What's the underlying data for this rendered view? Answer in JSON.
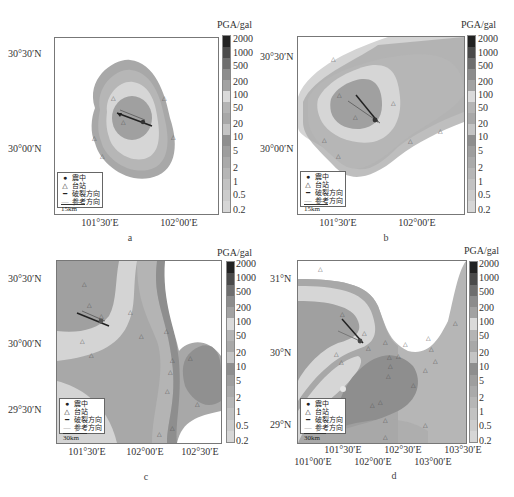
{
  "colorbar": {
    "title": "PGA/gal",
    "labels": [
      "2000",
      "1000",
      "500",
      "200",
      "100",
      "50",
      "20",
      "10",
      "5",
      "2",
      "1",
      "0.5",
      "0.2"
    ],
    "colors": [
      "#2a2a2a",
      "#4a4a4a",
      "#6e6e6e",
      "#8c8c8c",
      "#a2a2a2",
      "#d8d8d8",
      "#b6b6b6",
      "#9c9c9c",
      "#aaaaaa",
      "#8e8e8e",
      "#a6a6a6",
      "#b0b0b0",
      "#bcbcbc",
      "#c6c6c6",
      "#cfcfcf",
      "#d8d8d8"
    ]
  },
  "legend": {
    "epicenter": "震中",
    "station": "台站",
    "rupture_direction": "破裂方向",
    "reference_direction": "参考方向"
  },
  "panels": [
    {
      "id": "a",
      "caption": "a",
      "scale": "15km",
      "y_ticks": [
        "30°30′N",
        "30°00′N"
      ],
      "x_ticks": [
        "101°30′E",
        "102°00′E"
      ]
    },
    {
      "id": "b",
      "caption": "b",
      "scale": "15km",
      "y_ticks": [
        "30°30′N",
        "30°00′N"
      ],
      "x_ticks": [
        "101°30′E",
        "102°00′E"
      ]
    },
    {
      "id": "c",
      "caption": "c",
      "scale": "30km",
      "y_ticks": [
        "30°30′N",
        "30°00′N",
        "29°30′N"
      ],
      "x_ticks": [
        "101°30′E",
        "102°00′E",
        "102°30′E"
      ]
    },
    {
      "id": "d",
      "caption": "d",
      "scale": "30km",
      "y_ticks": [
        "31°N",
        "30°N",
        "29°N"
      ],
      "x_ticks_top": [
        "101°30′E",
        "102°30′E",
        "103°30′E"
      ],
      "x_ticks_bottom": [
        "101°00′E",
        "102°00′E",
        "103°00′E"
      ]
    }
  ],
  "icons": {
    "epicenter": "filled-circle",
    "station": "triangle-outline",
    "rupture_direction": "dark-arrow",
    "reference_direction": "gray-arrow"
  }
}
